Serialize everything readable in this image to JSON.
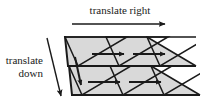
{
  "figure": {
    "kind": "tiling-translation-diagram",
    "background_color": "#ffffff",
    "tile_fill_color": "#d9d9d9",
    "outline_color": "#1a1a1a",
    "arrow_color": "#1a1a1a"
  },
  "labels": {
    "translate_right": "translate right",
    "translate_down_line1": "translate",
    "translate_down_line2": "down"
  },
  "arrows": {
    "top": {
      "name": "translate-right-arrow",
      "x1": 72,
      "y1": 24,
      "x2": 166,
      "y2": 24
    },
    "diagonal": {
      "name": "translate-down-arrow",
      "x1": 47,
      "y1": 38,
      "x2": 62,
      "y2": 97
    },
    "inner": [
      {
        "name": "inner-arrow-row1-a",
        "x1": 92,
        "y1": 54,
        "x2": 125,
        "y2": 54
      },
      {
        "name": "inner-arrow-row1-b",
        "x1": 133,
        "y1": 54,
        "x2": 166,
        "y2": 54
      },
      {
        "name": "inner-arrow-row2-a",
        "x1": 88,
        "y1": 82,
        "x2": 121,
        "y2": 82
      },
      {
        "name": "inner-arrow-row2-b",
        "x1": 129,
        "y1": 82,
        "x2": 162,
        "y2": 82
      },
      {
        "name": "inner-arrow-down-column",
        "x1": 76,
        "y1": 60,
        "x2": 82,
        "y2": 86
      }
    ]
  },
  "tiles": {
    "rows": 2,
    "columns": 3,
    "shape": "right-triangle",
    "row1_apex_x": [
      65,
      106,
      147
    ],
    "row1_apex_y": 37,
    "row2_apex_x": [
      69,
      110,
      151
    ],
    "row2_apex_y": 66,
    "row1_baseline_y": 66,
    "row2_baseline_y": 95,
    "tile_width": 62,
    "tile_step_x": 41,
    "row_shear_x": 4
  }
}
